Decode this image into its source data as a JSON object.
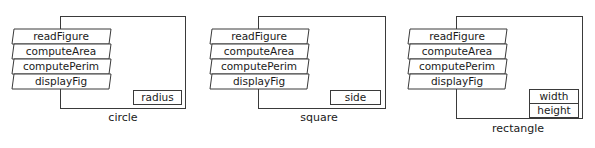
{
  "diagram": {
    "type": "class-objects",
    "objects": [
      {
        "name": "circle",
        "methods": [
          "readFigure",
          "computeArea",
          "computePerim",
          "displayFig"
        ],
        "fields": [
          "radius"
        ]
      },
      {
        "name": "square",
        "methods": [
          "readFigure",
          "computeArea",
          "computePerim",
          "displayFig"
        ],
        "fields": [
          "side"
        ]
      },
      {
        "name": "rectangle",
        "methods": [
          "readFigure",
          "computeArea",
          "computePerim",
          "displayFig"
        ],
        "fields": [
          "width",
          "height"
        ]
      }
    ]
  }
}
